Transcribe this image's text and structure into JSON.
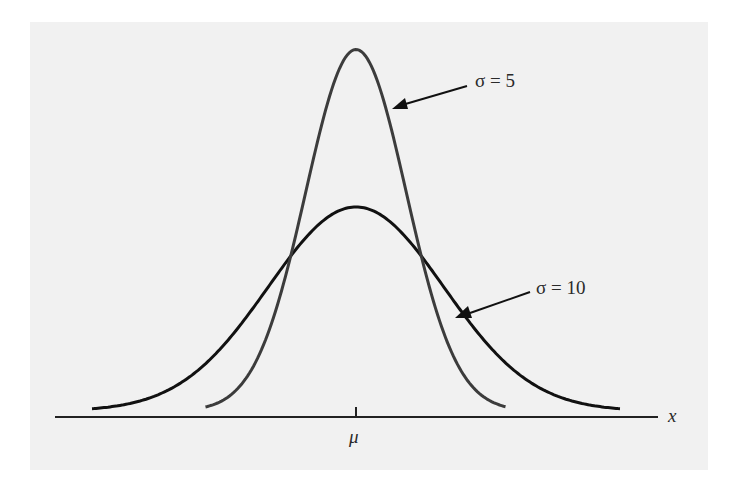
{
  "chart_data": {
    "type": "line",
    "title": "",
    "xlabel": "x",
    "ylabel": "",
    "x_tick_labels": [
      "μ"
    ],
    "grid": false,
    "legend": "annotations with arrows",
    "series": [
      {
        "name": "σ = 5",
        "sigma": 5,
        "mean_label": "μ",
        "peak_relative": 1.75,
        "range_sigmas": 3,
        "color": "#3c3c3c"
      },
      {
        "name": "σ = 10",
        "sigma": 10,
        "mean_label": "μ",
        "peak_relative": 1.0,
        "range_sigmas": 3,
        "color": "#111111"
      }
    ],
    "annotations": [
      {
        "text": "σ = 5",
        "points_to": "σ = 5 curve right flank"
      },
      {
        "text": "σ = 10",
        "points_to": "σ = 10 curve right flank"
      }
    ]
  },
  "labels": {
    "sigma5": "σ = 5",
    "sigma10": "σ = 10",
    "mu": "μ",
    "x": "x"
  },
  "colors": {
    "background": "#ffffff",
    "panel": "#f1f1f1",
    "curve_sigma5": "#3c3c3c",
    "curve_sigma10": "#111111",
    "axis": "#222222"
  }
}
